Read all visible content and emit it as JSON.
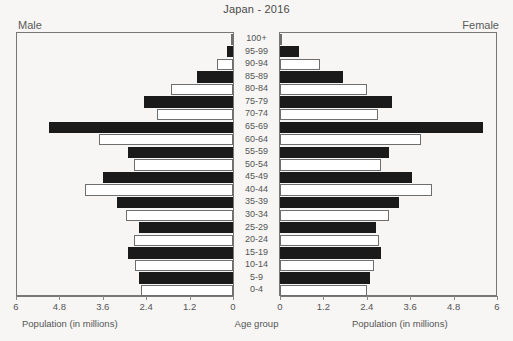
{
  "chart_data": {
    "type": "bar",
    "subtype": "population-pyramid",
    "title": "Japan - 2016",
    "xlabel": "Population (in millions)",
    "ylabel": "Age group",
    "grid": false,
    "legend": "none",
    "left_side_label": "Male",
    "right_side_label": "Female",
    "xlim": [
      0,
      6
    ],
    "xticks": [
      0,
      1.2,
      2.4,
      3.6,
      4.8,
      6
    ],
    "xticklabels_left": [
      "6",
      "4.8",
      "3.6",
      "2.4",
      "1.2",
      "0"
    ],
    "xticklabels_right": [
      "0",
      "1.2",
      "2.4",
      "3.6",
      "4.8",
      "6"
    ],
    "categories": [
      "100+",
      "95-99",
      "90-94",
      "85-89",
      "80-84",
      "75-79",
      "70-74",
      "65-69",
      "60-64",
      "55-59",
      "50-54",
      "45-49",
      "40-44",
      "35-39",
      "30-34",
      "25-29",
      "20-24",
      "15-19",
      "10-14",
      "5-9",
      "0-4"
    ],
    "series": [
      {
        "name": "Male",
        "side": "left",
        "values": [
          0.01,
          0.17,
          0.45,
          0.99,
          1.72,
          2.45,
          2.1,
          5.1,
          3.7,
          2.9,
          2.75,
          3.6,
          4.1,
          3.2,
          2.95,
          2.6,
          2.75,
          2.9,
          2.7,
          2.6,
          2.55
        ]
      },
      {
        "name": "Female",
        "side": "right",
        "values": [
          0.06,
          0.52,
          1.1,
          1.74,
          2.4,
          3.1,
          2.7,
          5.6,
          3.9,
          3.0,
          2.8,
          3.65,
          4.2,
          3.3,
          3.0,
          2.65,
          2.75,
          2.8,
          2.6,
          2.5,
          2.4
        ]
      }
    ],
    "bar_styles": [
      "hollow",
      "filled",
      "hollow",
      "filled",
      "hollow",
      "filled",
      "hollow",
      "filled",
      "hollow",
      "filled",
      "hollow",
      "filled",
      "hollow",
      "filled",
      "hollow",
      "filled",
      "hollow",
      "filled",
      "hollow",
      "filled",
      "hollow"
    ],
    "colors": {
      "filled": "#1a1a1a",
      "hollow_fill": "#ffffff",
      "hollow_stroke": "#6e6e6e",
      "background": "#f7f6f4",
      "text": "#555555",
      "frame": "#777777"
    }
  }
}
